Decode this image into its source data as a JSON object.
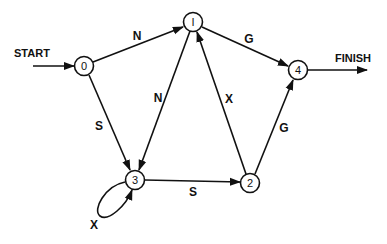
{
  "diagram": {
    "type": "state-transition-graph",
    "start_label": "START",
    "finish_label": "FINISH",
    "nodes": [
      {
        "id": "0",
        "label": "0"
      },
      {
        "id": "1",
        "label": "I"
      },
      {
        "id": "2",
        "label": "2"
      },
      {
        "id": "3",
        "label": "3"
      },
      {
        "id": "4",
        "label": "4"
      }
    ],
    "edges": [
      {
        "from": "0",
        "to": "1",
        "label": "N"
      },
      {
        "from": "0",
        "to": "3",
        "label": "S"
      },
      {
        "from": "1",
        "to": "3",
        "label": "N"
      },
      {
        "from": "1",
        "to": "4",
        "label": "G"
      },
      {
        "from": "2",
        "to": "1",
        "label": "X"
      },
      {
        "from": "2",
        "to": "4",
        "label": "G"
      },
      {
        "from": "3",
        "to": "2",
        "label": "S"
      },
      {
        "from": "3",
        "to": "3",
        "label": "X"
      }
    ],
    "stroke_color": "#111111",
    "background_color": "#ffffff"
  }
}
